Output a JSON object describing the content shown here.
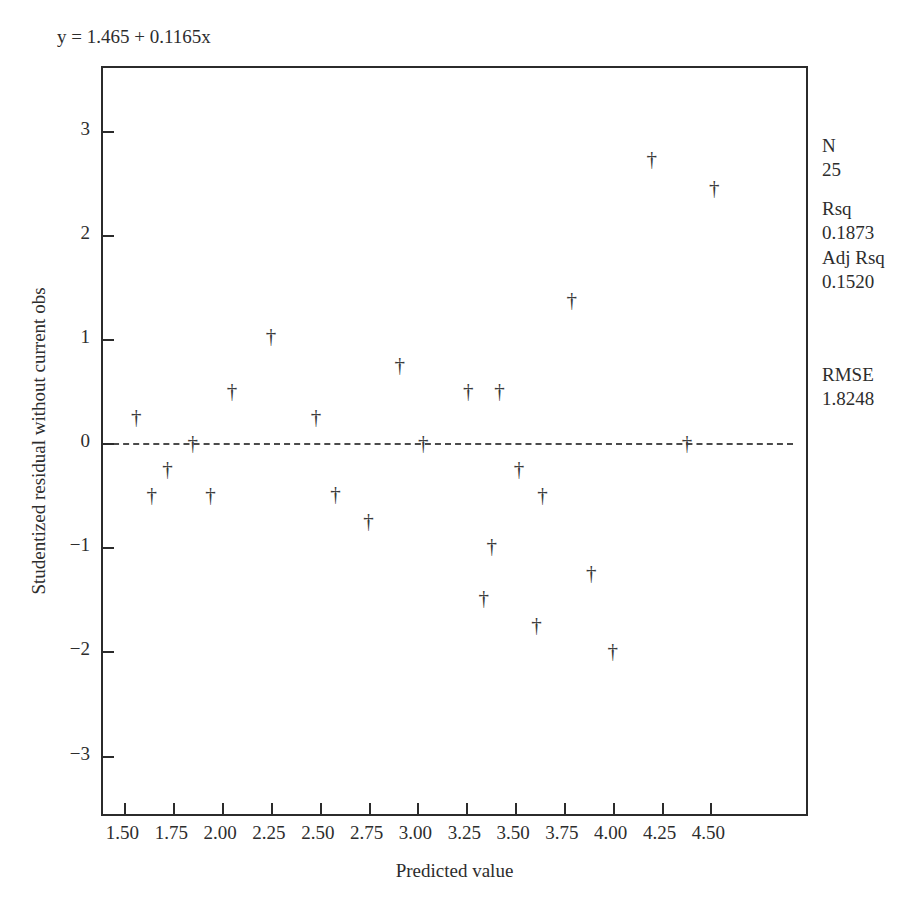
{
  "annotation": {
    "equation": "y = 1.465 + 0.1165x"
  },
  "axes": {
    "x_title": "Predicted value",
    "y_title": "Studentized residual without current obs",
    "x_ticks": [
      "1.50",
      "1.75",
      "2.00",
      "2.25",
      "2.50",
      "2.75",
      "3.00",
      "3.25",
      "3.50",
      "3.75",
      "4.00",
      "4.25",
      "4.50"
    ],
    "y_ticks": [
      "3",
      "2",
      "1",
      "0",
      "−1",
      "−2",
      "−3"
    ]
  },
  "stats": {
    "n_label": "N",
    "n_value": "25",
    "rsq_label": "Rsq",
    "rsq_value": "0.1873",
    "adj_rsq_label": "Adj Rsq",
    "adj_rsq_value": "0.1520",
    "rmse_label": "RMSE",
    "rmse_value": "1.8248"
  },
  "marker_glyph": "†",
  "chart_data": {
    "type": "scatter",
    "title": "",
    "xlabel": "Predicted value",
    "ylabel": "Studentized residual without current obs",
    "xlim": [
      1.39,
      5.01
    ],
    "ylim": [
      -3.6,
      3.6
    ],
    "grid": false,
    "legend": "none",
    "reference_line": {
      "type": "horizontal",
      "y": 0,
      "style": "dashed"
    },
    "fit_equation": "y = 1.465 + 0.1165x",
    "marker": "dagger",
    "n_points": 25,
    "points": [
      {
        "x": 1.56,
        "y": 0.25
      },
      {
        "x": 1.64,
        "y": -0.5
      },
      {
        "x": 1.72,
        "y": -0.25
      },
      {
        "x": 1.85,
        "y": 0.0
      },
      {
        "x": 1.94,
        "y": -0.5
      },
      {
        "x": 2.05,
        "y": 0.5
      },
      {
        "x": 2.25,
        "y": 1.03
      },
      {
        "x": 2.48,
        "y": 0.25
      },
      {
        "x": 2.58,
        "y": -0.49
      },
      {
        "x": 2.75,
        "y": -0.75
      },
      {
        "x": 2.91,
        "y": 0.75
      },
      {
        "x": 3.03,
        "y": 0.0
      },
      {
        "x": 3.26,
        "y": 0.5
      },
      {
        "x": 3.34,
        "y": -1.49
      },
      {
        "x": 3.38,
        "y": -0.99
      },
      {
        "x": 3.42,
        "y": 0.5
      },
      {
        "x": 3.52,
        "y": -0.25
      },
      {
        "x": 3.61,
        "y": -1.75
      },
      {
        "x": 3.64,
        "y": -0.5
      },
      {
        "x": 3.79,
        "y": 1.37
      },
      {
        "x": 3.89,
        "y": -1.25
      },
      {
        "x": 4.0,
        "y": -2.0
      },
      {
        "x": 4.2,
        "y": 2.73
      },
      {
        "x": 4.38,
        "y": 0.0
      },
      {
        "x": 4.52,
        "y": 2.45
      }
    ]
  }
}
